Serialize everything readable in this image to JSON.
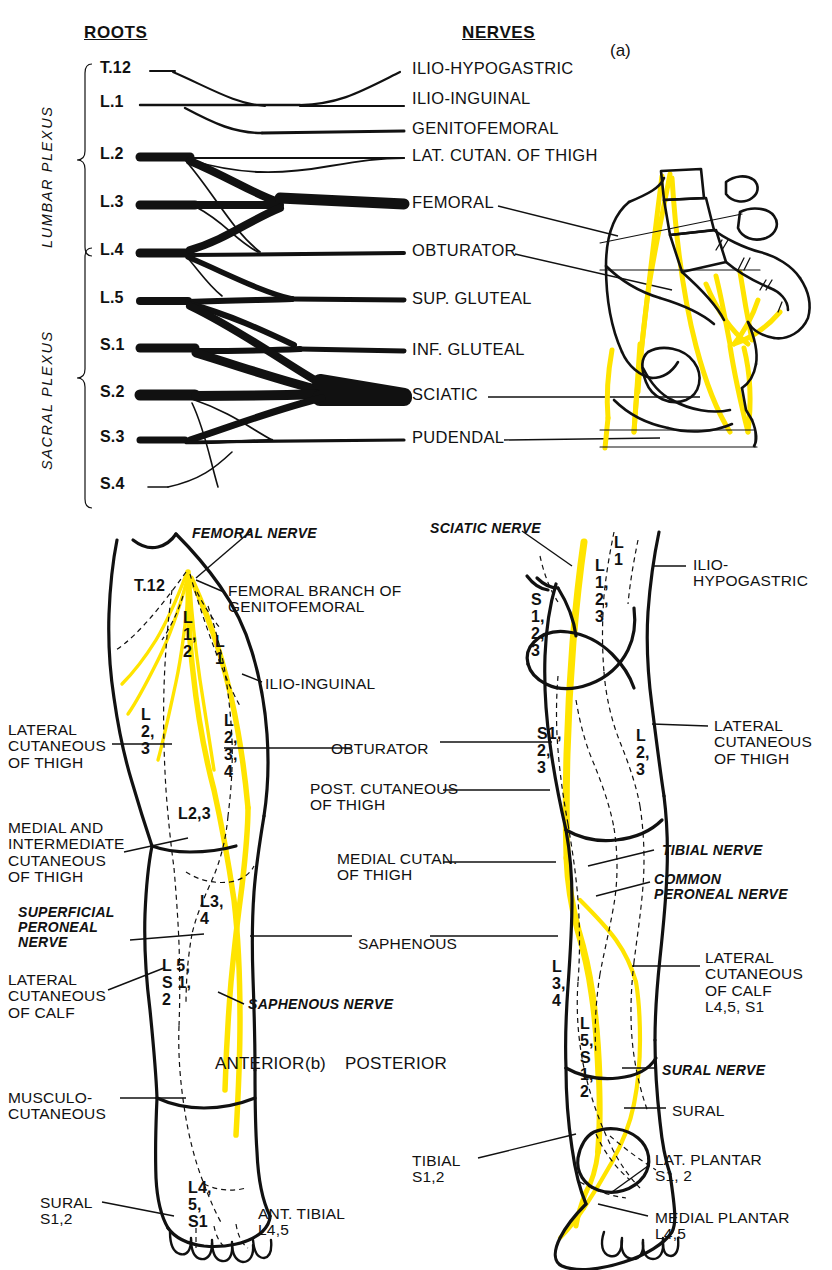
{
  "figure": {
    "panel_a_label": "(a)",
    "panel_b_label": "(b)",
    "accent_nerve_color": "#FFE400",
    "ink_color": "#111111"
  },
  "plexus": {
    "col_roots_header": "ROOTS",
    "col_nerves_header": "NERVES",
    "group_lumbar": "LUMBAR PLEXUS",
    "group_sacral": "SACRAL PLEXUS",
    "roots": [
      {
        "label": "T.12",
        "y": 71
      },
      {
        "label": "L.1",
        "y": 105
      },
      {
        "label": "L.2",
        "y": 157
      },
      {
        "label": "L.3",
        "y": 205
      },
      {
        "label": "L.4",
        "y": 253
      },
      {
        "label": "L.5",
        "y": 301
      },
      {
        "label": "S.1",
        "y": 348
      },
      {
        "label": "S.2",
        "y": 395
      },
      {
        "label": "S.3",
        "y": 440
      },
      {
        "label": "S.4",
        "y": 487
      }
    ],
    "nerves": [
      {
        "label": "ILIO-HYPOGASTRIC",
        "y": 71,
        "weight": 2
      },
      {
        "label": "ILIO-INGUINAL",
        "y": 101,
        "weight": 2
      },
      {
        "label": "GENITOFEMORAL",
        "y": 131,
        "weight": 3
      },
      {
        "label": "LAT. CUTAN. OF THIGH",
        "y": 158,
        "weight": 2
      },
      {
        "label": "FEMORAL",
        "y": 205,
        "weight": 11
      },
      {
        "label": "OBTURATOR",
        "y": 253,
        "weight": 4
      },
      {
        "label": "SUP. GLUTEAL",
        "y": 301,
        "weight": 5
      },
      {
        "label": "INF. GLUTEAL",
        "y": 352,
        "weight": 5
      },
      {
        "label": "SCIATIC",
        "y": 397,
        "weight": 18
      },
      {
        "label": "PUDENDAL",
        "y": 440,
        "weight": 4
      }
    ]
  },
  "anterior": {
    "caption": "ANTERIOR",
    "labels_left": [
      {
        "text": "LATERAL\nCUTANEOUS\nOF THIGH",
        "x": 8,
        "y": 722,
        "style": "panel"
      },
      {
        "text": "MEDIAL AND\nINTERMEDIATE\nCUTANEOUS\nOF THIGH",
        "x": 8,
        "y": 820,
        "style": "panel"
      },
      {
        "text": "SUPERFICIAL\nPERONEAL\nNERVE",
        "x": 18,
        "y": 905,
        "style": "ital"
      },
      {
        "text": "LATERAL\nCUTANEOUS\nOF CALF",
        "x": 8,
        "y": 972,
        "style": "panel"
      },
      {
        "text": "MUSCULO-\nCUTANEOUS",
        "x": 8,
        "y": 1090,
        "style": "panel"
      },
      {
        "text": "SURAL\nS1,2",
        "x": 40,
        "y": 1195,
        "style": "panel"
      }
    ],
    "labels_top": [
      {
        "text": "FEMORAL NERVE",
        "x": 192,
        "y": 526,
        "style": "ital"
      },
      {
        "text": "FEMORAL BRANCH OF\nGENITOFEMORAL",
        "x": 228,
        "y": 583,
        "style": "panel"
      },
      {
        "text": "ILIO-INGUINAL",
        "x": 265,
        "y": 676,
        "style": "panel"
      },
      {
        "text": "ANT. TIBIAL\nL4,5",
        "x": 258,
        "y": 1206,
        "style": "panel"
      },
      {
        "text": "SAPHENOUS NERVE",
        "x": 248,
        "y": 997,
        "style": "ital"
      }
    ],
    "segments": [
      {
        "text": "T.12",
        "x": 134,
        "y": 578
      },
      {
        "text": "L\n1,\n2",
        "x": 183,
        "y": 610
      },
      {
        "text": "L\n1",
        "x": 215,
        "y": 634
      },
      {
        "text": "L\n2,\n3",
        "x": 141,
        "y": 707
      },
      {
        "text": "L\n2,\n3,\n4",
        "x": 224,
        "y": 713
      },
      {
        "text": "L2,3",
        "x": 178,
        "y": 806
      },
      {
        "text": "L3,\n4",
        "x": 200,
        "y": 894
      },
      {
        "text": "L 5,\nS 1,\n2",
        "x": 162,
        "y": 958
      },
      {
        "text": "L4,\n5,\nS1",
        "x": 188,
        "y": 1180
      }
    ]
  },
  "posterior": {
    "caption": "POSTERIOR",
    "labels_center": [
      {
        "text": "SCIATIC NERVE",
        "x": 430,
        "y": 521,
        "style": "ital"
      },
      {
        "text": "OBTURATOR",
        "x": 331,
        "y": 741,
        "style": "panel"
      },
      {
        "text": "POST. CUTANEOUS\nOF THIGH",
        "x": 310,
        "y": 781,
        "style": "panel"
      },
      {
        "text": "MEDIAL CUTAN.\nOF THIGH",
        "x": 337,
        "y": 851,
        "style": "panel"
      },
      {
        "text": "SAPHENOUS",
        "x": 358,
        "y": 936,
        "style": "panel"
      },
      {
        "text": "TIBIAL\nS1,2",
        "x": 412,
        "y": 1153,
        "style": "panel"
      }
    ],
    "labels_right": [
      {
        "text": "ILIO-\nHYPOGASTRIC",
        "x": 693,
        "y": 557,
        "style": "panel"
      },
      {
        "text": "LATERAL\nCUTANEOUS\nOF THIGH",
        "x": 714,
        "y": 718,
        "style": "panel"
      },
      {
        "text": "TIBIAL NERVE",
        "x": 662,
        "y": 843,
        "style": "ital"
      },
      {
        "text": "COMMON\nPERONEAL NERVE",
        "x": 654,
        "y": 872,
        "style": "ital"
      },
      {
        "text": "LATERAL\nCUTANEOUS\nOF CALF\nL4,5, S1",
        "x": 705,
        "y": 950,
        "style": "panel"
      },
      {
        "text": "SURAL NERVE",
        "x": 662,
        "y": 1063,
        "style": "ital"
      },
      {
        "text": "SURAL",
        "x": 672,
        "y": 1103,
        "style": "panel"
      },
      {
        "text": "LAT. PLANTAR\nS1, 2",
        "x": 655,
        "y": 1152,
        "style": "panel"
      },
      {
        "text": "MEDIAL PLANTAR\nL4,5",
        "x": 655,
        "y": 1210,
        "style": "panel"
      }
    ],
    "segments": [
      {
        "text": "S\n1,\n2,\n3",
        "x": 531,
        "y": 592
      },
      {
        "text": "L\n1",
        "x": 614,
        "y": 535
      },
      {
        "text": "L\n1,\n2,\n3",
        "x": 595,
        "y": 558
      },
      {
        "text": "S1,\n2,\n3",
        "x": 537,
        "y": 726
      },
      {
        "text": "L\n2,\n3",
        "x": 636,
        "y": 728
      },
      {
        "text": "L\n3,\n4",
        "x": 552,
        "y": 959
      },
      {
        "text": "L\n5,\nS\n1,\n2",
        "x": 580,
        "y": 1016
      }
    ]
  }
}
